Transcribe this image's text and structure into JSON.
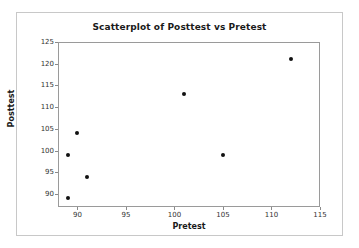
{
  "chart_data": {
    "type": "scatter",
    "title": "Scatterplot of Posttest vs Pretest",
    "xlabel": "Pretest",
    "ylabel": "Posttest",
    "xlim": [
      88,
      115
    ],
    "ylim": [
      87,
      125
    ],
    "xticks": [
      90,
      95,
      100,
      105,
      110,
      115
    ],
    "xtick_labels": [
      "90",
      "95",
      "100",
      "105",
      "110",
      "115"
    ],
    "yticks": [
      90,
      95,
      100,
      105,
      110,
      115,
      120,
      125
    ],
    "ytick_labels": [
      "90",
      "95",
      "100",
      "105",
      "110",
      "115",
      "120",
      "125"
    ],
    "grid": false,
    "legend": false,
    "marker": "filled-circle",
    "marker_color": "#111111",
    "x": [
      89,
      89,
      90,
      91,
      101,
      105,
      112
    ],
    "y": [
      89,
      99,
      104,
      94,
      113,
      99,
      121
    ],
    "points": [
      {
        "x": 89,
        "y": 89
      },
      {
        "x": 89,
        "y": 99
      },
      {
        "x": 90,
        "y": 104
      },
      {
        "x": 91,
        "y": 94
      },
      {
        "x": 101,
        "y": 113
      },
      {
        "x": 105,
        "y": 99
      },
      {
        "x": 112,
        "y": 121
      }
    ]
  },
  "colors": {
    "frame": "#9a9a9a",
    "outer_border": "#c8c8c8",
    "text": "#1a1a1a",
    "tick_text": "#333333",
    "background": "#ffffff",
    "marker": "#111111"
  }
}
